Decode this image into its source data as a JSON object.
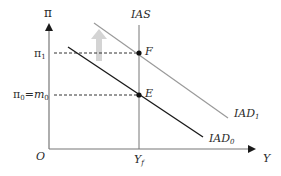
{
  "diagram": {
    "type": "IAS-IAD macroeconomic diagram",
    "axes": {
      "y_label": "π",
      "x_label": "Y",
      "origin_label": "O"
    },
    "curves": {
      "ias": {
        "label": "IAS"
      },
      "iad1": {
        "label_main": "IAD",
        "label_sub": "1",
        "color": "#9a9a9a"
      },
      "iad0": {
        "label_main": "IAD",
        "label_sub": "0",
        "color": "#1a1a1a"
      }
    },
    "levels": {
      "pi1": {
        "label_main": "π",
        "label_sub": "1"
      },
      "pi0": {
        "label_main": "π",
        "label_sub": "0",
        "eq": "=",
        "m_main": "m",
        "m_sub": "0"
      }
    },
    "points": {
      "F": "F",
      "E": "E"
    },
    "x_ticks": {
      "yf_main": "Y",
      "yf_sub": "f"
    },
    "shift_arrow": {
      "direction": "up",
      "color": "#d0d0d0"
    }
  }
}
